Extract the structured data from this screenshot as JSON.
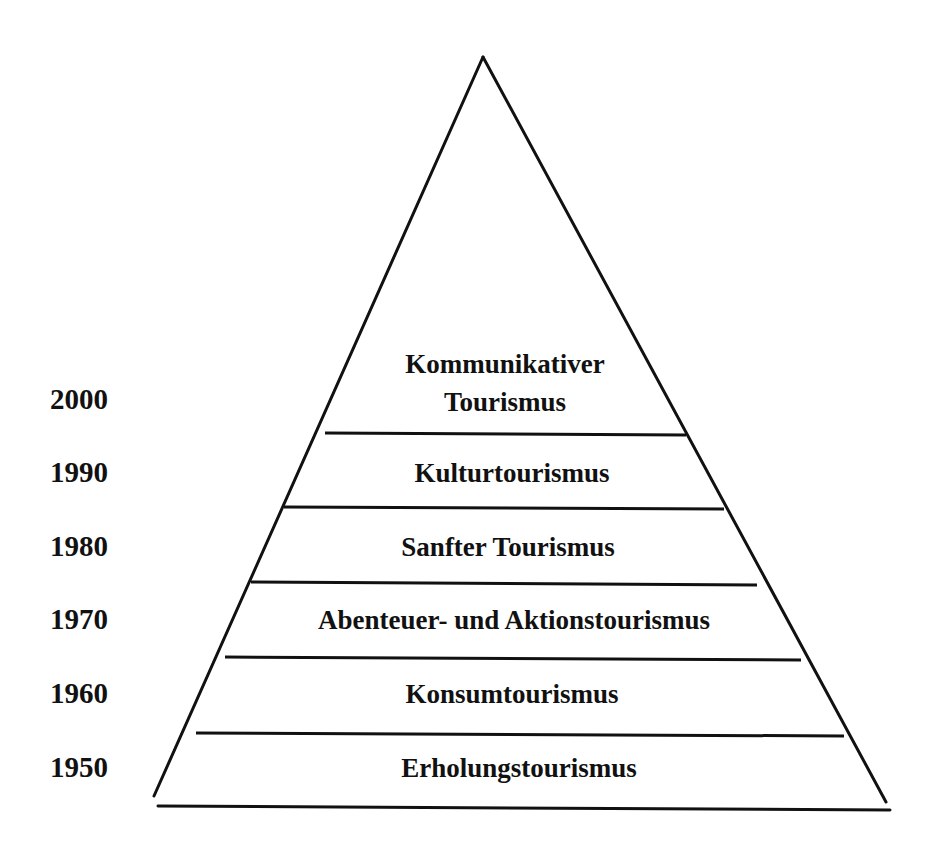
{
  "diagram": {
    "type": "pyramid",
    "line_color": "#111111",
    "background": "#ffffff",
    "years": [
      "2000",
      "1990",
      "1980",
      "1970",
      "1960",
      "1950"
    ],
    "layers": [
      {
        "line1": "Kommunikativer",
        "line2": "Tourismus",
        "year": "2000"
      },
      {
        "line1": "Kulturtourismus",
        "year": "1990"
      },
      {
        "line1": "Sanfter Tourismus",
        "year": "1980"
      },
      {
        "line1": "Abenteuer- und Aktionstourismus",
        "year": "1970"
      },
      {
        "line1": "Konsumtourismus",
        "year": "1960"
      },
      {
        "line1": "Erholungstourismus",
        "year": "1950"
      }
    ]
  }
}
